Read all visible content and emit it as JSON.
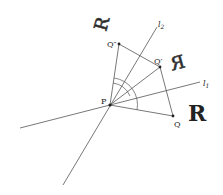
{
  "diagram": {
    "points": {
      "P": {
        "label": "P",
        "x": 110,
        "y": 105
      },
      "Q": {
        "label": "Q",
        "x": 173,
        "y": 116
      },
      "Q1": {
        "label": "Q′",
        "x": 160,
        "y": 67
      },
      "Q2": {
        "label": "Q″",
        "x": 119,
        "y": 44
      }
    },
    "lines": {
      "l1": {
        "label": "l",
        "subscript": "1"
      },
      "l2": {
        "label": "l",
        "subscript": "2"
      }
    },
    "glyphs": {
      "original": "R",
      "reflected": "R",
      "rotated": "R"
    },
    "colors": {
      "stroke": "#444444",
      "text": "#222222"
    }
  }
}
